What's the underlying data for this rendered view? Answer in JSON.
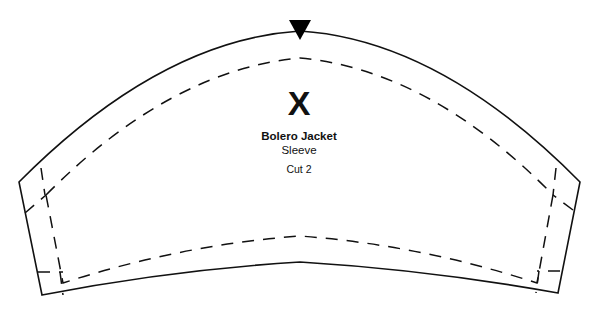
{
  "pattern": {
    "garment": "Bolero Jacket",
    "piece": "Sleeve",
    "cut": "Cut 2",
    "center_mark": "X",
    "line_color": "#111111",
    "notch_color": "#000000",
    "background": "#ffffff"
  }
}
